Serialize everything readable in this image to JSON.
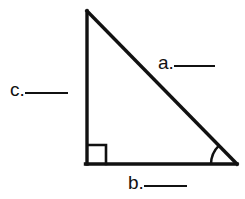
{
  "figure": {
    "name": "right-triangle-labeling-exercise",
    "background_color": "#ffffff",
    "stroke_color": "#111111",
    "geometry": {
      "apex": [
        87,
        11
      ],
      "right_angle_vertex": [
        87,
        164
      ],
      "acute_vertex": [
        236,
        164
      ],
      "vertical_leg_length_px": 153,
      "horizontal_leg_length_px": 149,
      "stroke_width_px": 3.4,
      "right_angle_marker_size_px": 19,
      "angle_arc_radius_px": 26
    },
    "labels": [
      {
        "id": "a",
        "name": "hypotenuse-label",
        "text": "a.",
        "blank": "____",
        "side": "hypotenuse",
        "position": [
          158,
          53
        ]
      },
      {
        "id": "c",
        "name": "vertical-leg-label",
        "text": "c.",
        "blank": "____",
        "side": "vertical-leg",
        "position": [
          10,
          80
        ]
      },
      {
        "id": "b",
        "name": "horizontal-leg-label",
        "text": "b.",
        "blank": "____",
        "side": "horizontal-leg",
        "position": [
          128,
          173
        ]
      }
    ],
    "markers": {
      "right_angle": "right-angle-square",
      "acute_angle": "angle-arc"
    }
  }
}
